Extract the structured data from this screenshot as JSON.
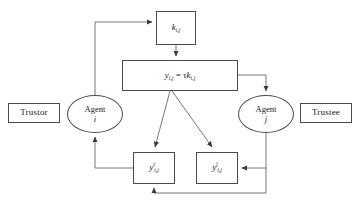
{
  "diagram": {
    "nodes": {
      "trustor": {
        "label": "Trustor",
        "shape": "rect"
      },
      "trustee": {
        "label": "Trustee",
        "shape": "rect"
      },
      "k": {
        "label": "k",
        "sub": "i,j",
        "shape": "rect"
      },
      "formula": {
        "label": "y",
        "sub": "i,j",
        "eq": " = ",
        "tau": "τ",
        "k": "k",
        "ksub": "i,j",
        "shape": "rect",
        "full_text": "y_{i,j} = τ k_{i,j}"
      },
      "agent_i": {
        "label": "Agent",
        "index": "i",
        "shape": "ellipse"
      },
      "agent_j": {
        "label": "Agent",
        "index": "j",
        "shape": "ellipse"
      },
      "y_i": {
        "label": "y",
        "sup": "i",
        "sub": "i,j",
        "shape": "rect",
        "full_text": "y^{i}_{i,j}"
      },
      "y_j": {
        "label": "y",
        "sup": "j",
        "sub": "i,j",
        "shape": "rect",
        "full_text": "y^{j}_{i,j}"
      }
    },
    "edges": [
      {
        "name": "agent-i-to-k",
        "from": "agent_i",
        "to": "k",
        "style": "orthogonal",
        "arrow": true
      },
      {
        "name": "k-to-formula",
        "from": "k",
        "to": "formula",
        "style": "straight-down",
        "arrow": true
      },
      {
        "name": "formula-to-agent-j",
        "from": "formula",
        "to": "agent_j",
        "style": "orthogonal",
        "arrow": true
      },
      {
        "name": "formula-to-y-i",
        "from": "formula",
        "to": "y_i",
        "style": "diagonal",
        "arrow": true
      },
      {
        "name": "formula-to-y-j",
        "from": "formula",
        "to": "y_j",
        "style": "diagonal",
        "arrow": true
      },
      {
        "name": "agent-j-to-y-j",
        "from": "agent_j",
        "to": "y_j",
        "style": "orthogonal",
        "arrow": true
      },
      {
        "name": "agent-j-to-y-i",
        "from": "agent_j",
        "to": "y_i",
        "style": "orthogonal-bottom",
        "arrow": true
      },
      {
        "name": "y-i-to-agent-i",
        "from": "y_i",
        "to": "agent_i",
        "style": "orthogonal",
        "arrow": true
      }
    ],
    "colors": {
      "stroke": "#4a4a4a",
      "text": "#1a1a1a",
      "background": "#ffffff"
    }
  }
}
